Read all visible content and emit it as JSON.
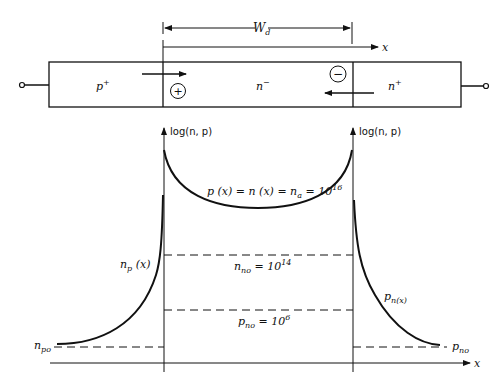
{
  "device": {
    "regions": [
      {
        "label": "p",
        "sup": "+"
      },
      {
        "label": "n",
        "sup": "−"
      },
      {
        "label": "n",
        "sup": "+"
      }
    ],
    "depletion_width_label": "W",
    "depletion_width_sub": "d",
    "x_axis_label": "x",
    "hole_symbol": "+",
    "electron_symbol": "−"
  },
  "plot": {
    "left_axis_label": "log(n, p)",
    "right_axis_label": "log(n, p)",
    "x_axis_label": "x",
    "curves": {
      "center": {
        "text": "p (x) = n (x) = n",
        "sub": "a",
        "eq": " = 10",
        "exp": "16"
      },
      "left": {
        "text": "n",
        "sub": "p",
        "suffix": " (x)"
      },
      "right": {
        "text": "p",
        "sub": "n(x)"
      }
    },
    "levels": {
      "n_no": {
        "text": "n",
        "sub": "no",
        "eq": " = 10",
        "exp": "14"
      },
      "p_no": {
        "text": "p",
        "sub": "no",
        "eq": " = 10",
        "exp": "6"
      },
      "n_po": {
        "text": "n",
        "sub": "po"
      },
      "p_no_right": {
        "text": "p",
        "sub": "no"
      }
    }
  },
  "colors": {
    "ink": "#111111",
    "background": "#ffffff"
  }
}
